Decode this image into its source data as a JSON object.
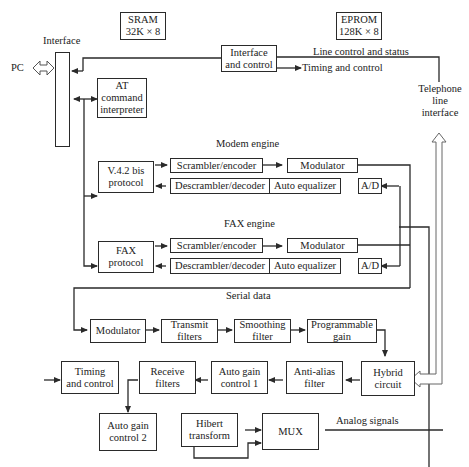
{
  "diagram": {
    "type": "block-diagram",
    "memory": {
      "sram": "SRAM\n32K × 8",
      "eprom": "EPROM\n128K × 8"
    },
    "labels": {
      "interface": "Interface",
      "pc": "PC",
      "line_control_status": "Line control and status",
      "timing_control_out": "Timing and control",
      "telephone_line_interface": "Telephone\nline\ninterface",
      "modem_engine": "Modem engine",
      "fax_engine": "FAX engine",
      "serial_data": "Serial data",
      "analog_signals": "Analog signals"
    },
    "blocks": {
      "interface_control": "Interface\nand control",
      "at_command": "AT\ncommand\ninterpreter",
      "v42bis": "V.4.2 bis\nprotocol",
      "modem_scrambler": "Scrambler/encoder",
      "modem_modulator": "Modulator",
      "modem_descrambler": "Descrambler/decoder",
      "modem_equalizer": "Auto equalizer",
      "modem_ad": "A/D",
      "fax_protocol": "FAX\nprotocol",
      "fax_scrambler": "Scrambler/encoder",
      "fax_modulator": "Modulator",
      "fax_descrambler": "Descrambler/decoder",
      "fax_equalizer": "Auto equalizer",
      "fax_ad": "A/D",
      "tx_modulator": "Modulator",
      "transmit_filters": "Transmit\nfilters",
      "smoothing_filter": "Smoothing\nfilter",
      "programmable_gain": "Programmable\ngain",
      "hybrid_circuit": "Hybrid\ncircuit",
      "timing_control": "Timing\nand control",
      "receive_filters": "Receive\nfilters",
      "agc1": "Auto gain\ncontrol 1",
      "anti_alias": "Anti-alias\nfilter",
      "agc2": "Auto gain\ncontrol 2",
      "hilbert": "Hibert\ntransform",
      "mux": "MUX"
    }
  }
}
